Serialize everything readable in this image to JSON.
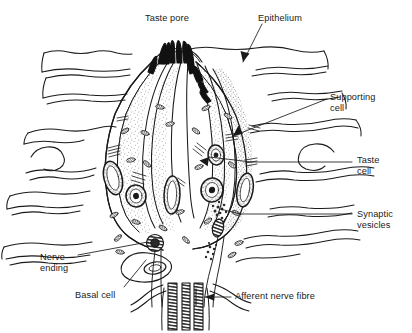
{
  "figure": {
    "type": "labelled-biological-diagram",
    "background_color": "#ffffff",
    "ink_color": "#1a1a1a"
  },
  "labels": {
    "taste_pore": "Taste pore",
    "epithelium": "Epithelium",
    "supporting_cell": "Supporting\ncell",
    "taste_cell": "Taste\ncell",
    "synaptic_vesicles": "Synaptic\nvesicles",
    "nerve_ending": "Nerve\nending",
    "basal_cell": "Basal cell",
    "afferent_nerve_fibre": "Afferent nerve fibre"
  },
  "label_positions": {
    "taste_pore": {
      "x": 145,
      "y": 13
    },
    "epithelium": {
      "x": 258,
      "y": 13
    },
    "supporting_cell": {
      "x": 330,
      "y": 92
    },
    "taste_cell": {
      "x": 357,
      "y": 155
    },
    "synaptic_vesicles": {
      "x": 357,
      "y": 209
    },
    "nerve_ending": {
      "x": 40,
      "y": 252
    },
    "basal_cell": {
      "x": 75,
      "y": 290
    },
    "afferent_nerve_fibre": {
      "x": 235,
      "y": 293
    }
  },
  "leader_lines": [
    {
      "from": "epithelium",
      "to": "epithelium-tissue",
      "arrow": true
    },
    {
      "from": "supporting-cell-label",
      "to": "supporting-cell-body",
      "arrow": true
    },
    {
      "from": "taste-cell-label",
      "to": "taste-cell-body",
      "arrow": false
    },
    {
      "from": "synaptic-vesicles-label",
      "to": "synaptic-vesicle-cluster",
      "arrow": false
    },
    {
      "from": "nerve-ending-label",
      "to": "nerve-ending-terminal",
      "arrow": false
    },
    {
      "from": "basal-cell-label",
      "to": "basal-cell-body",
      "arrow": false
    },
    {
      "from": "afferent-nerve-fibre-label",
      "to": "afferent-nerve-bundle",
      "arrow": true
    }
  ],
  "structures": [
    "taste-pore",
    "microvilli",
    "epithelium-layers",
    "taste-bud-outline",
    "supporting-cells",
    "taste-cells",
    "cell-nuclei",
    "mitochondria",
    "golgi-bodies",
    "synaptic-vesicles",
    "basal-cell",
    "nerve-endings",
    "afferent-nerve-fibre"
  ]
}
